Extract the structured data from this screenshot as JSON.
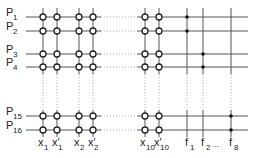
{
  "diagram": {
    "type": "crossbar-array",
    "rows": [
      {
        "name": "P",
        "sub": "1",
        "y": 17
      },
      {
        "name": "P",
        "sub": "2",
        "y": 31
      },
      {
        "name": "P",
        "sub": "3",
        "y": 54
      },
      {
        "name": "P",
        "sub": "4",
        "y": 67
      },
      {
        "name": "P",
        "sub": "15",
        "y": 116
      },
      {
        "name": "P",
        "sub": "16",
        "y": 130
      }
    ],
    "input_columns": [
      {
        "name": "x",
        "sub": "1",
        "prime": false,
        "x": 43
      },
      {
        "name": "x",
        "sub": "1",
        "prime": true,
        "x": 57
      },
      {
        "name": "x",
        "sub": "2",
        "prime": false,
        "x": 79
      },
      {
        "name": "x",
        "sub": "2",
        "prime": true,
        "x": 93
      },
      {
        "name": "x",
        "sub": "10",
        "prime": false,
        "x": 145
      },
      {
        "name": "x",
        "sub": "10",
        "prime": true,
        "x": 159
      }
    ],
    "output_columns": [
      {
        "name": "f",
        "sub": "1",
        "x": 187,
        "dots_on_rows": [
          0,
          1
        ]
      },
      {
        "name": "f",
        "sub": "2",
        "x": 203,
        "dots_on_rows": [
          2,
          3
        ]
      },
      {
        "name": "f",
        "sub": "8",
        "x": 231,
        "dots_on_rows": [
          4,
          5
        ]
      }
    ],
    "ellipsis": "...",
    "colors": {
      "line": "#555555",
      "node_fill": "#ffffff",
      "node_stroke": "#222222",
      "dot": "#111111"
    }
  }
}
